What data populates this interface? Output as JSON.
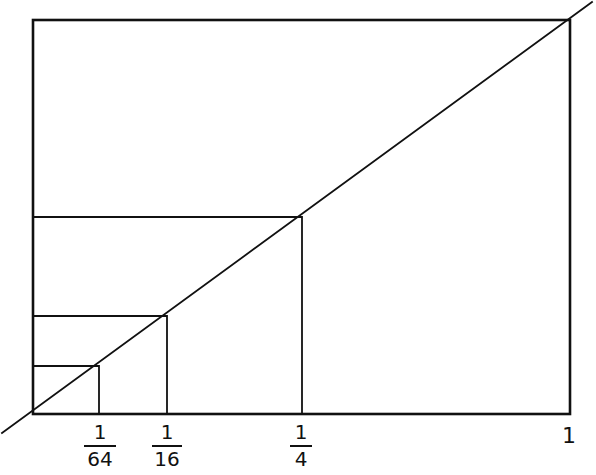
{
  "diagram": {
    "type": "geometric-construction",
    "stroke_color": "#111111",
    "background": "#ffffff",
    "frame": {
      "x0": 33,
      "y0": 20,
      "x1": 570,
      "y1": 414
    },
    "diagonal": {
      "from": [
        2,
        433
      ],
      "to": [
        592,
        2
      ]
    },
    "marks": [
      {
        "name": "one-sixty-fourth",
        "x": 99,
        "y": 366,
        "label_num": "1",
        "label_den": "64"
      },
      {
        "name": "one-sixteenth",
        "x": 167,
        "y": 316,
        "label_num": "1",
        "label_den": "16"
      },
      {
        "name": "one-quarter",
        "x": 302,
        "y": 217,
        "label_num": "1",
        "label_den": "4"
      }
    ],
    "end_label": "1"
  }
}
